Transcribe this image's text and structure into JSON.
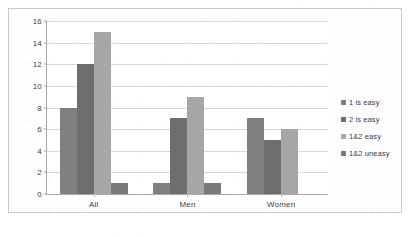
{
  "chart_data": {
    "type": "bar",
    "title": "",
    "subtitle": "",
    "xlabel": "",
    "ylabel": "",
    "categories": [
      "All",
      "Men",
      "Women"
    ],
    "series": [
      {
        "name": "1 is easy",
        "values": [
          8,
          1,
          7
        ],
        "color": "#7f7f7f"
      },
      {
        "name": "2 is easy",
        "values": [
          12,
          7,
          5
        ],
        "color": "#6e6e6e"
      },
      {
        "name": "1&2 easy",
        "values": [
          15,
          9,
          6
        ],
        "color": "#a6a6a6"
      },
      {
        "name": "1&2 uneasy",
        "values": [
          1,
          1,
          0
        ],
        "color": "#7a7a7a"
      }
    ],
    "ylim": [
      0,
      16
    ],
    "yticks": [
      0,
      2,
      4,
      6,
      8,
      10,
      12,
      14,
      16
    ],
    "grid": true,
    "legend_position": "right",
    "plot_background": "#ffffff",
    "gridline_color": "#d8d8d8",
    "axis_color": "#a8a8a8",
    "frame_color": "#c9c9c9",
    "tick_label_color": "#3d3d3d"
  }
}
